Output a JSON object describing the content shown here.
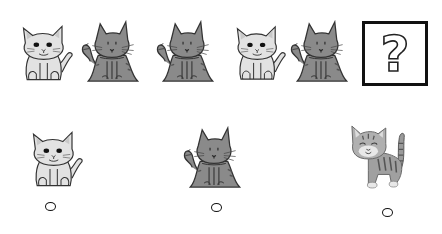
{
  "puzzle": {
    "title": "What comes next in the pattern?",
    "sequence": [
      {
        "kind": "light-cat",
        "label": "White cat"
      },
      {
        "kind": "gray-cat",
        "label": "Gray cat"
      },
      {
        "kind": "gray-cat",
        "label": "Gray cat"
      },
      {
        "kind": "light-cat",
        "label": "White cat"
      },
      {
        "kind": "gray-cat",
        "label": "Gray cat"
      }
    ],
    "unknown": {
      "symbol": "?",
      "label": "Missing item"
    }
  },
  "options": [
    {
      "kind": "light-cat",
      "label": "White cat"
    },
    {
      "kind": "gray-cat",
      "label": "Gray cat"
    },
    {
      "kind": "tabby-kitten",
      "label": "Tabby kitten"
    }
  ],
  "colors": {
    "light_cat_fill": "#e2e2e2",
    "gray_cat_fill": "#8a8a8a",
    "outline": "#333333",
    "box_border": "#111111"
  }
}
